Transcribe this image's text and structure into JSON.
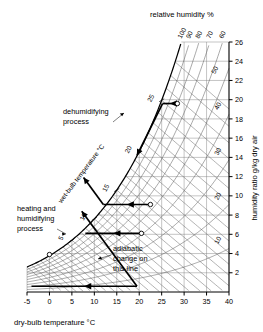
{
  "chart_data": {
    "type": "line",
    "title": "",
    "chart_kind": "psychrometric-chart",
    "xlabel": "dry-bulb temperature °C",
    "ylabel": "humidity ratio g/kg dry air",
    "top_label": "relative humidity %",
    "wetbulb_label": "wet-bulb temperature °C",
    "xlim": [
      -5,
      40
    ],
    "ylim": [
      0,
      26
    ],
    "grid": true,
    "x_ticks": [
      "-5",
      "0",
      "5",
      "10",
      "15",
      "20",
      "25",
      "30",
      "35",
      "40"
    ],
    "x_tick_values": [
      -5,
      0,
      5,
      10,
      15,
      20,
      25,
      30,
      35,
      40
    ],
    "y_ticks": [
      "2",
      "4",
      "6",
      "8",
      "10",
      "12",
      "14",
      "16",
      "18",
      "20",
      "22",
      "24",
      "26"
    ],
    "y_tick_values": [
      2,
      4,
      6,
      8,
      10,
      12,
      14,
      16,
      18,
      20,
      22,
      24,
      26
    ],
    "rh_curve_labels": [
      "100",
      "90",
      "80",
      "70",
      "60",
      "50",
      "40",
      "30",
      "20",
      "10"
    ],
    "rh_curve_values": [
      100,
      90,
      80,
      70,
      60,
      50,
      40,
      30,
      20,
      10
    ],
    "wetbulb_tick_labels": [
      "5",
      "10",
      "15",
      "20",
      "25"
    ],
    "wetbulb_tick_values": [
      5,
      10,
      15,
      20,
      25
    ],
    "legend_position": "none",
    "annotations": [
      {
        "id": "dehumidifying",
        "text": "dehumidifying\nprocess",
        "line1": "dehumidifying",
        "line2": "process"
      },
      {
        "id": "heating-humidifying",
        "text": "heating and\nhumidifying\nprocess",
        "line1": "heating and",
        "line2": "humidifying",
        "line3": "process"
      },
      {
        "id": "adiabatic",
        "text": "adiabatic\nchange on\nthis line",
        "line1": "adiabatic",
        "line2": "change on",
        "line3": "this line"
      }
    ],
    "processes": [
      {
        "name": "dehumidifying",
        "from": {
          "db": 28.5,
          "w": 19.6
        },
        "to": {
          "db": 25.2,
          "w": 19.6
        },
        "then_to": {
          "db": 19.5,
          "w": 14.2
        }
      },
      {
        "name": "heating-humidifying-upper",
        "from": {
          "db": 22.5,
          "w": 9.1
        },
        "to": {
          "db": 12.0,
          "w": 9.1
        }
      },
      {
        "name": "heating-humidifying-lower",
        "from": {
          "db": 20.5,
          "w": 6.1
        },
        "to": {
          "db": 8.0,
          "w": 6.1
        }
      },
      {
        "name": "adiabatic-base",
        "from": {
          "db": 19.5,
          "w": 0.6
        },
        "to": {
          "db": -4.0,
          "w": 0.6
        }
      }
    ],
    "state_points": [
      {
        "db": 28.5,
        "w": 19.6
      },
      {
        "db": 22.5,
        "w": 9.1
      },
      {
        "db": 20.5,
        "w": 6.1
      },
      {
        "db": 0.0,
        "w": 3.9
      }
    ]
  },
  "axes": {
    "x_title": "dry-bulb temperature °C",
    "y_title": "humidity ratio g/kg dry air",
    "top_title": "relative humidity %",
    "wetbulb_title": "wet-bulb temperature °C"
  }
}
